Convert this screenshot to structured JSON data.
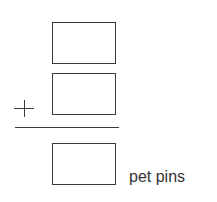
{
  "problem": {
    "operator": "+",
    "addend_1": "",
    "addend_2": "",
    "sum": "",
    "unit_label": "pet pins"
  }
}
